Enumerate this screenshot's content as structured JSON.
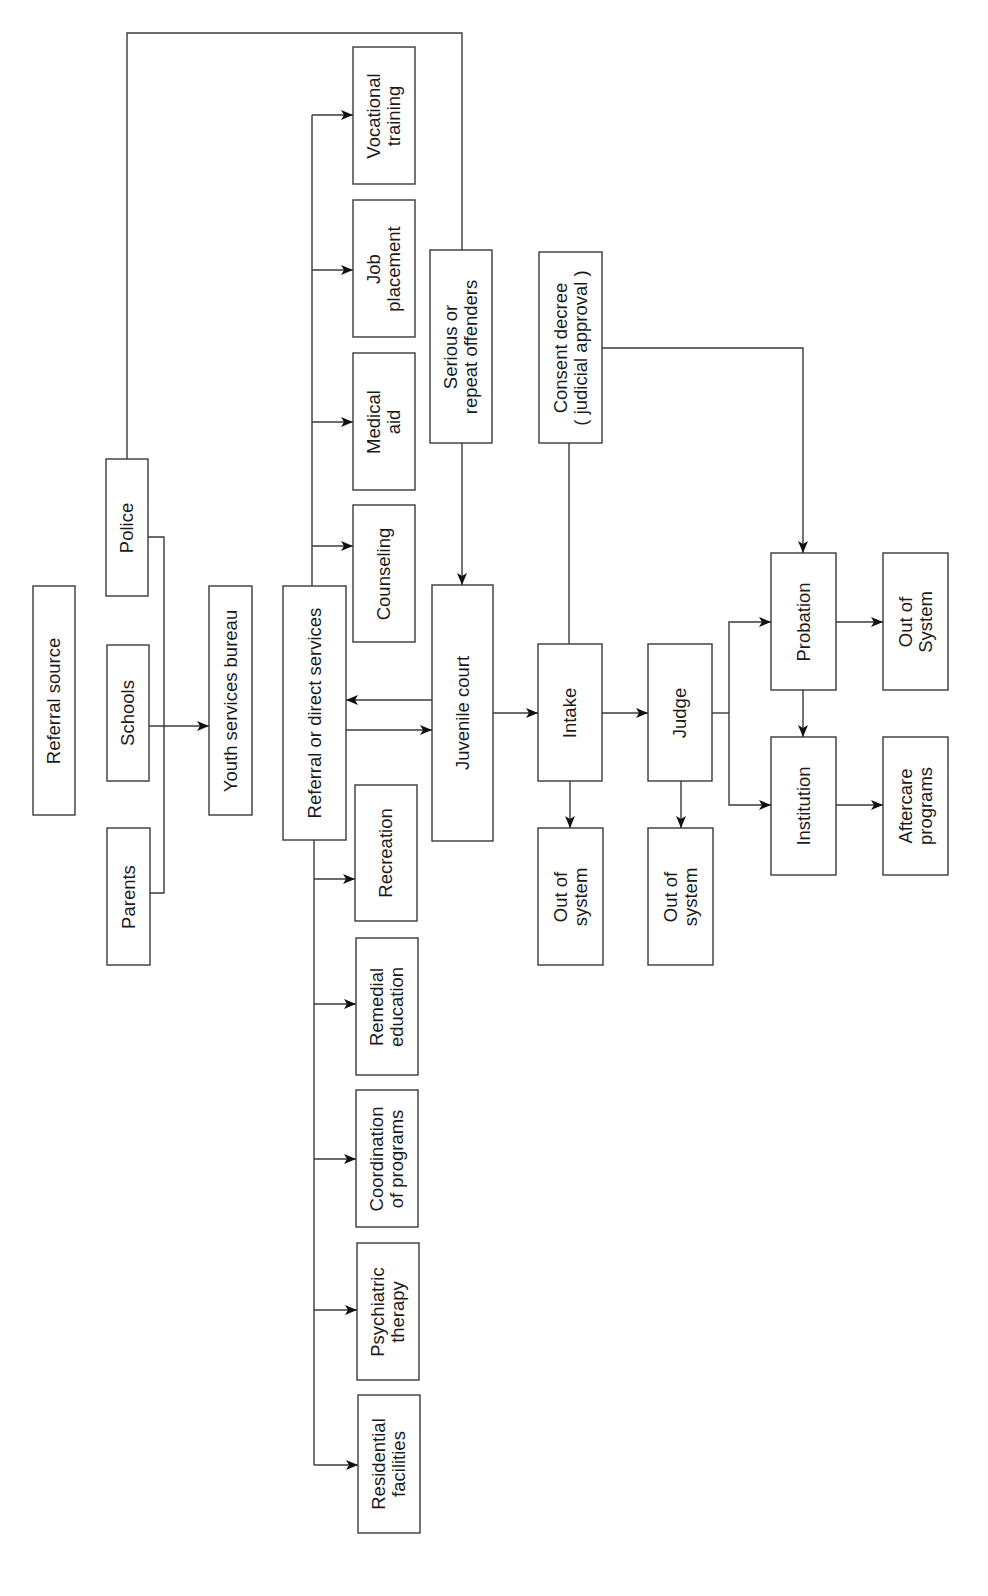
{
  "diagram": {
    "type": "flowchart",
    "orientation": "rotated-90-ccw",
    "stroke_color": "#3a3a3a",
    "background": "#ffffff",
    "nodes": {
      "referral_source": {
        "label": "Referral source",
        "x": 33,
        "y": 586,
        "w": 42,
        "h": 229
      },
      "police": {
        "label": "Police",
        "x": 106,
        "y": 459,
        "w": 42,
        "h": 137
      },
      "schools": {
        "label": "Schools",
        "x": 107,
        "y": 645,
        "w": 42,
        "h": 136
      },
      "parents": {
        "label": "Parents",
        "x": 107,
        "y": 828,
        "w": 43,
        "h": 137
      },
      "youth_bureau": {
        "label": "Youth services bureau",
        "x": 209,
        "y": 586,
        "w": 43,
        "h": 229
      },
      "referral_direct": {
        "label": "Referral or direct services",
        "x": 283,
        "y": 586,
        "w": 63,
        "h": 254
      },
      "vocational": {
        "line1": "Vocational",
        "line2": "training",
        "x": 353,
        "y": 47,
        "w": 62,
        "h": 137
      },
      "job": {
        "line1": "Job",
        "line2": "placement",
        "x": 353,
        "y": 200,
        "w": 62,
        "h": 137
      },
      "medical": {
        "line1": "Medical",
        "line2": "aid",
        "x": 353,
        "y": 353,
        "w": 62,
        "h": 137
      },
      "counseling": {
        "label": "Counseling",
        "x": 353,
        "y": 505,
        "w": 62,
        "h": 137
      },
      "recreation": {
        "label": "Recreation",
        "x": 355,
        "y": 785,
        "w": 62,
        "h": 136
      },
      "remedial": {
        "line1": "Remedial",
        "line2": "education",
        "x": 356,
        "y": 938,
        "w": 62,
        "h": 137
      },
      "coordination": {
        "line1": "Coordination",
        "line2": "of programs",
        "x": 356,
        "y": 1090,
        "w": 62,
        "h": 137
      },
      "psychiatric": {
        "line1": "Psychiatric",
        "line2": "therapy",
        "x": 357,
        "y": 1243,
        "w": 62,
        "h": 137
      },
      "residential": {
        "line1": "Residential",
        "line2": "facilities",
        "x": 358,
        "y": 1395,
        "w": 62,
        "h": 138
      },
      "serious": {
        "line1": "Serious or",
        "line2": "repeat offenders",
        "x": 430,
        "y": 250,
        "w": 62,
        "h": 193
      },
      "juvenile_court": {
        "label": "Juvenile court",
        "x": 432,
        "y": 585,
        "w": 61,
        "h": 256
      },
      "consent": {
        "line1": "Consent decree",
        "line2": "( judicial approval )",
        "x": 539,
        "y": 252,
        "w": 63,
        "h": 191
      },
      "intake": {
        "label": "Intake",
        "x": 538,
        "y": 644,
        "w": 64,
        "h": 137
      },
      "judge": {
        "label": "Judge",
        "x": 648,
        "y": 644,
        "w": 64,
        "h": 137
      },
      "out_intake": {
        "line1": "Out of",
        "line2": "system",
        "x": 538,
        "y": 828,
        "w": 65,
        "h": 137
      },
      "out_judge": {
        "line1": "Out of",
        "line2": "system",
        "x": 648,
        "y": 828,
        "w": 65,
        "h": 137
      },
      "probation": {
        "label": "Probation",
        "x": 771,
        "y": 553,
        "w": 65,
        "h": 137
      },
      "institution": {
        "label": "Institution",
        "x": 771,
        "y": 737,
        "w": 65,
        "h": 138
      },
      "out_probation": {
        "line1": "Out of",
        "line2": "System",
        "x": 883,
        "y": 553,
        "w": 65,
        "h": 137
      },
      "aftercare": {
        "line1": "Aftercare",
        "line2": "programs",
        "x": 883,
        "y": 737,
        "w": 65,
        "h": 138
      }
    },
    "edges": [
      {
        "from": "police",
        "to": "serious",
        "style": "line",
        "note": "police loops over top to serious offenders"
      },
      {
        "from": "police",
        "to": "youth_bureau",
        "style": "bracket"
      },
      {
        "from": "parents",
        "to": "youth_bureau",
        "style": "bracket"
      },
      {
        "from": "schools",
        "to": "youth_bureau",
        "style": "arrow"
      },
      {
        "from": "referral_direct",
        "to": "vocational",
        "style": "arrow"
      },
      {
        "from": "referral_direct",
        "to": "job",
        "style": "arrow"
      },
      {
        "from": "referral_direct",
        "to": "medical",
        "style": "arrow"
      },
      {
        "from": "referral_direct",
        "to": "counseling",
        "style": "arrow"
      },
      {
        "from": "referral_direct",
        "to": "recreation",
        "style": "arrow"
      },
      {
        "from": "referral_direct",
        "to": "remedial",
        "style": "arrow"
      },
      {
        "from": "referral_direct",
        "to": "coordination",
        "style": "arrow"
      },
      {
        "from": "referral_direct",
        "to": "psychiatric",
        "style": "arrow"
      },
      {
        "from": "referral_direct",
        "to": "residential",
        "style": "arrow"
      },
      {
        "from": "juvenile_court",
        "to": "referral_direct",
        "style": "arrow"
      },
      {
        "from": "referral_direct",
        "to": "juvenile_court",
        "style": "arrow"
      },
      {
        "from": "serious",
        "to": "juvenile_court",
        "style": "arrow"
      },
      {
        "from": "juvenile_court",
        "to": "intake",
        "style": "arrow"
      },
      {
        "from": "intake",
        "to": "consent",
        "style": "line"
      },
      {
        "from": "consent",
        "to": "probation",
        "style": "arrow"
      },
      {
        "from": "intake",
        "to": "judge",
        "style": "arrow"
      },
      {
        "from": "intake",
        "to": "out_intake",
        "style": "arrow"
      },
      {
        "from": "judge",
        "to": "out_judge",
        "style": "arrow"
      },
      {
        "from": "judge",
        "to": "probation",
        "style": "arrow"
      },
      {
        "from": "judge",
        "to": "institution",
        "style": "arrow"
      },
      {
        "from": "probation",
        "to": "institution",
        "style": "arrow"
      },
      {
        "from": "probation",
        "to": "out_probation",
        "style": "arrow"
      },
      {
        "from": "institution",
        "to": "aftercare",
        "style": "arrow"
      }
    ]
  }
}
